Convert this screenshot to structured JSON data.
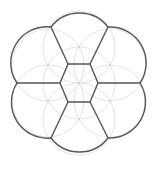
{
  "diagram": {
    "title": "",
    "type": "voronoi-flower",
    "width": 158,
    "height": 169,
    "center": [
      79,
      83
    ],
    "colors": {
      "background": "#ffffff",
      "edge": "#555555",
      "construction": "#e4e4e4",
      "site_dot": "#bbbbbb"
    },
    "construction_circle_radius": 36,
    "sites": [
      [
        79,
        83
      ],
      [
        79,
        47
      ],
      [
        110,
        65
      ],
      [
        110,
        101
      ],
      [
        79,
        119
      ],
      [
        48,
        101
      ],
      [
        48,
        65
      ]
    ],
    "inner_hexagon": [
      [
        68,
        64
      ],
      [
        90,
        64
      ],
      [
        98,
        83
      ],
      [
        90,
        102
      ],
      [
        68,
        102
      ],
      [
        60,
        83
      ]
    ],
    "outer_vertices": [
      [
        51,
        27
      ],
      [
        108,
        27
      ],
      [
        140,
        83
      ],
      [
        108,
        138
      ],
      [
        51,
        138
      ],
      [
        17,
        83
      ]
    ]
  }
}
